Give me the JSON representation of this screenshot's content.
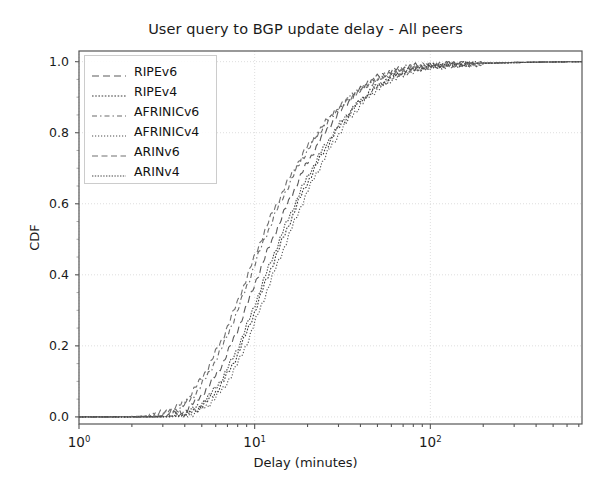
{
  "chart_data": {
    "type": "line",
    "title": "User query to BGP update delay - All peers",
    "xlabel": "Delay (minutes)",
    "ylabel": "CDF",
    "xscale": "log",
    "yscale": "linear",
    "xlim": [
      1,
      730
    ],
    "ylim": [
      -0.02,
      1.03
    ],
    "xtick_labels": [
      "10",
      "10",
      "10"
    ],
    "xtick_exponents": [
      "0",
      "1",
      "2"
    ],
    "xtick_values": [
      1,
      10,
      100
    ],
    "ytick_labels": [
      "0.0",
      "0.2",
      "0.4",
      "0.6",
      "0.8",
      "1.0"
    ],
    "ytick_values": [
      0.0,
      0.2,
      0.4,
      0.6,
      0.8,
      1.0
    ],
    "grid": true,
    "grid_style": "dotted",
    "legend_position": "upper left",
    "legend_entries": [
      "RIPEv6",
      "RIPEv4",
      "AFRINICv6",
      "AFRINICv4",
      "ARINv6",
      "ARINv4"
    ],
    "series": [
      {
        "name": "RIPEv6",
        "dash": "7,4",
        "color": "#5a5a5a",
        "width": 1.1,
        "x": [
          1,
          1.6,
          2.2,
          2.8,
          3.3,
          3.8,
          4.2,
          4.6,
          5.0,
          5.5,
          6.0,
          6.6,
          7.2,
          7.9,
          8.6,
          9.4,
          10.2,
          11.1,
          12.1,
          13.2,
          14.4,
          15.7,
          17.1,
          18.6,
          20.3,
          22.2,
          24.2,
          26.4,
          28.8,
          31.4,
          34.2,
          37.3,
          40.7,
          44.4,
          48.4,
          52.8,
          57.6,
          62.8,
          68.5,
          80,
          100,
          140,
          200,
          300,
          450,
          730
        ],
        "y": [
          0.0,
          0.0,
          0.0,
          0.002,
          0.006,
          0.014,
          0.026,
          0.043,
          0.062,
          0.088,
          0.118,
          0.152,
          0.193,
          0.238,
          0.286,
          0.336,
          0.385,
          0.432,
          0.478,
          0.522,
          0.566,
          0.608,
          0.648,
          0.686,
          0.722,
          0.756,
          0.787,
          0.816,
          0.842,
          0.866,
          0.888,
          0.908,
          0.925,
          0.94,
          0.952,
          0.962,
          0.97,
          0.977,
          0.982,
          0.987,
          0.991,
          0.994,
          0.996,
          0.998,
          0.999,
          1.0
        ]
      },
      {
        "name": "RIPEv4",
        "dash": "1.6,1.6",
        "color": "#3a3a3a",
        "width": 1.1,
        "x": [
          1,
          1.6,
          2.2,
          2.8,
          3.3,
          3.8,
          4.2,
          4.6,
          5.0,
          5.5,
          6.0,
          6.6,
          7.2,
          7.9,
          8.6,
          9.4,
          10.2,
          11.1,
          12.1,
          13.2,
          14.4,
          15.7,
          17.1,
          18.6,
          20.3,
          22.2,
          24.2,
          26.4,
          28.8,
          31.4,
          34.2,
          37.3,
          40.7,
          44.4,
          48.4,
          52.8,
          57.6,
          62.8,
          68.5,
          80,
          100,
          140,
          200,
          300,
          450,
          730
        ],
        "y": [
          0.0,
          0.0,
          0.0,
          0.0,
          0.001,
          0.004,
          0.009,
          0.018,
          0.031,
          0.048,
          0.07,
          0.098,
          0.131,
          0.17,
          0.213,
          0.26,
          0.308,
          0.357,
          0.405,
          0.452,
          0.498,
          0.543,
          0.587,
          0.628,
          0.667,
          0.704,
          0.739,
          0.771,
          0.8,
          0.827,
          0.851,
          0.874,
          0.894,
          0.912,
          0.927,
          0.94,
          0.951,
          0.961,
          0.969,
          0.979,
          0.987,
          0.992,
          0.995,
          0.997,
          0.999,
          1.0
        ]
      },
      {
        "name": "AFRINICv6",
        "dash": "5,3,1.5,3",
        "color": "#6a6a6a",
        "width": 1.1,
        "x": [
          1,
          1.6,
          2.2,
          2.8,
          3.3,
          3.8,
          4.2,
          4.6,
          5.0,
          5.5,
          6.0,
          6.6,
          7.2,
          7.9,
          8.6,
          9.4,
          10.2,
          11.1,
          12.1,
          13.2,
          14.4,
          15.7,
          17.1,
          18.6,
          20.3,
          22.2,
          24.2,
          26.4,
          28.8,
          31.4,
          34.2,
          37.3,
          40.7,
          44.4,
          48.4,
          52.8,
          57.6,
          62.8,
          68.5,
          80,
          100,
          140,
          200,
          300,
          450,
          730
        ],
        "y": [
          0.0,
          0.0,
          0.001,
          0.005,
          0.013,
          0.026,
          0.044,
          0.066,
          0.092,
          0.124,
          0.16,
          0.2,
          0.245,
          0.292,
          0.341,
          0.391,
          0.44,
          0.487,
          0.532,
          0.575,
          0.616,
          0.655,
          0.692,
          0.726,
          0.757,
          0.786,
          0.812,
          0.836,
          0.858,
          0.878,
          0.896,
          0.912,
          0.926,
          0.938,
          0.949,
          0.958,
          0.966,
          0.973,
          0.979,
          0.985,
          0.99,
          0.994,
          0.996,
          0.998,
          0.999,
          1.0
        ]
      },
      {
        "name": "AFRINICv4",
        "dash": "1.2,1.8",
        "color": "#4f4f4f",
        "width": 1.1,
        "x": [
          1,
          1.6,
          2.2,
          2.8,
          3.3,
          3.8,
          4.2,
          4.6,
          5.0,
          5.5,
          6.0,
          6.6,
          7.2,
          7.9,
          8.6,
          9.4,
          10.2,
          11.1,
          12.1,
          13.2,
          14.4,
          15.7,
          17.1,
          18.6,
          20.3,
          22.2,
          24.2,
          26.4,
          28.8,
          31.4,
          34.2,
          37.3,
          40.7,
          44.4,
          48.4,
          52.8,
          57.6,
          62.8,
          68.5,
          80,
          100,
          140,
          200,
          300,
          450,
          730
        ],
        "y": [
          0.0,
          0.0,
          0.0,
          0.0,
          0.0,
          0.002,
          0.006,
          0.012,
          0.022,
          0.036,
          0.055,
          0.079,
          0.109,
          0.144,
          0.184,
          0.228,
          0.275,
          0.323,
          0.371,
          0.419,
          0.466,
          0.512,
          0.557,
          0.6,
          0.641,
          0.68,
          0.716,
          0.75,
          0.781,
          0.81,
          0.836,
          0.86,
          0.881,
          0.9,
          0.917,
          0.931,
          0.944,
          0.955,
          0.964,
          0.975,
          0.985,
          0.991,
          0.995,
          0.997,
          0.999,
          1.0
        ]
      },
      {
        "name": "ARINv6",
        "dash": "6,3.5",
        "color": "#707070",
        "width": 1.1,
        "x": [
          1,
          1.6,
          2.2,
          2.8,
          3.3,
          3.8,
          4.2,
          4.6,
          5.0,
          5.5,
          6.0,
          6.6,
          7.2,
          7.9,
          8.6,
          9.4,
          10.2,
          11.1,
          12.1,
          13.2,
          14.4,
          15.7,
          17.1,
          18.6,
          20.3,
          22.2,
          24.2,
          26.4,
          28.8,
          31.4,
          34.2,
          37.3,
          40.7,
          44.4,
          48.4,
          52.8,
          57.6,
          62.8,
          68.5,
          80,
          100,
          140,
          200,
          300,
          450,
          730
        ],
        "y": [
          0.0,
          0.0,
          0.002,
          0.008,
          0.019,
          0.035,
          0.056,
          0.081,
          0.11,
          0.144,
          0.182,
          0.224,
          0.269,
          0.317,
          0.366,
          0.415,
          0.463,
          0.509,
          0.553,
          0.594,
          0.633,
          0.67,
          0.704,
          0.736,
          0.765,
          0.792,
          0.817,
          0.839,
          0.859,
          0.878,
          0.895,
          0.91,
          0.923,
          0.935,
          0.946,
          0.955,
          0.963,
          0.97,
          0.976,
          0.983,
          0.989,
          0.993,
          0.996,
          0.998,
          0.999,
          1.0
        ]
      },
      {
        "name": "ARINv4",
        "dash": "1.4,1.4",
        "color": "#454545",
        "width": 1.1,
        "x": [
          1,
          1.6,
          2.2,
          2.8,
          3.3,
          3.8,
          4.2,
          4.6,
          5.0,
          5.5,
          6.0,
          6.6,
          7.2,
          7.9,
          8.6,
          9.4,
          10.2,
          11.1,
          12.1,
          13.2,
          14.4,
          15.7,
          17.1,
          18.6,
          20.3,
          22.2,
          24.2,
          26.4,
          28.8,
          31.4,
          34.2,
          37.3,
          40.7,
          44.4,
          48.4,
          52.8,
          57.6,
          62.8,
          68.5,
          80,
          100,
          140,
          200,
          300,
          450,
          730
        ],
        "y": [
          0.0,
          0.0,
          0.0,
          0.0,
          0.002,
          0.006,
          0.013,
          0.024,
          0.039,
          0.058,
          0.082,
          0.112,
          0.147,
          0.187,
          0.231,
          0.278,
          0.327,
          0.376,
          0.425,
          0.472,
          0.518,
          0.562,
          0.604,
          0.644,
          0.682,
          0.717,
          0.75,
          0.78,
          0.807,
          0.832,
          0.855,
          0.875,
          0.893,
          0.909,
          0.923,
          0.936,
          0.947,
          0.957,
          0.965,
          0.976,
          0.986,
          0.991,
          0.995,
          0.997,
          0.999,
          1.0
        ]
      }
    ]
  },
  "axes": {
    "ytick_labels": [
      "1.0",
      "0.8",
      "0.6",
      "0.4",
      "0.2",
      "0.0"
    ],
    "xtick_mantissa": "10",
    "xtick_exps": [
      "0",
      "1",
      "2"
    ]
  }
}
